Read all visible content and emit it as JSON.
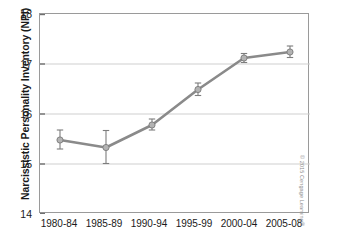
{
  "chart_data": {
    "type": "line",
    "title": "",
    "xlabel": "",
    "ylabel": "Narcissistic Personality Inventory (NPI)",
    "categories": [
      "1980-84",
      "1985-89",
      "1990-94",
      "1995-99",
      "2000-04",
      "2005-08"
    ],
    "values": [
      15.48,
      15.33,
      15.78,
      16.49,
      17.12,
      17.24
    ],
    "error_low": [
      15.3,
      15.01,
      15.68,
      16.37,
      17.03,
      17.13
    ],
    "error_high": [
      15.68,
      15.67,
      15.9,
      16.62,
      17.21,
      17.36
    ],
    "ylim": [
      14,
      18
    ],
    "yticks": [
      "14",
      "15",
      "16",
      "17",
      "18"
    ],
    "grid": true,
    "legend": "none",
    "series_color": "#8a8a8a",
    "marker_color": "#b3b3b3"
  },
  "credit": {
    "text": "© 2015 Cengage Learning®"
  }
}
